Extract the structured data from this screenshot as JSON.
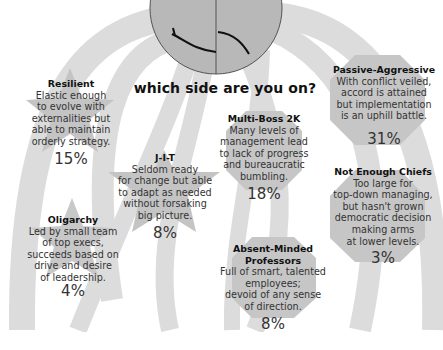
{
  "title": "which side are you on?",
  "center_graphic": {
    "icon": "split-face-icon",
    "left_half": "smile",
    "right_half": "frown"
  },
  "types": [
    {
      "id": "resilient",
      "name": "Resilient",
      "lines": [
        "Elastic enough",
        "to evolve with",
        "externalities but",
        "able to maintain",
        "orderly strategy."
      ],
      "percent": "15%",
      "shape": "star"
    },
    {
      "id": "oligarchy",
      "name": "Oligarchy",
      "lines": [
        "Led by small team",
        "of top execs,",
        "succeeds based on",
        "drive and desire",
        "of leadership."
      ],
      "percent": "4%",
      "shape": "star"
    },
    {
      "id": "jit",
      "name": "J-I-T",
      "lines": [
        "Seldom ready",
        "for  change but able",
        "to adapt as needed",
        "without forsaking",
        "big picture."
      ],
      "percent": "8%",
      "shape": "star"
    },
    {
      "id": "multiboss",
      "name": "Multi-Boss 2K",
      "lines": [
        "Many levels of",
        "management lead",
        "to lack of progress",
        "and bureaucratic",
        "bumbling."
      ],
      "percent": "18%",
      "shape": "octagon"
    },
    {
      "id": "absent",
      "name": "Absent-Minded",
      "name2": "Professors",
      "lines": [
        "Full of smart, talented",
        "employees;",
        "devoid of any sense",
        "of direction."
      ],
      "percent": "8%",
      "shape": "octagon"
    },
    {
      "id": "passive",
      "name": "Passive-Aggressive",
      "lines": [
        "With conflict veiled,",
        "accord is attained",
        "but implementation",
        "is an uphill battle."
      ],
      "percent": "31%",
      "shape": "octagon"
    },
    {
      "id": "chiefs",
      "name": "Not Enough Chiefs",
      "lines": [
        "Too large for",
        "top-down managing,",
        "but hasn't grown",
        "democratic decision",
        "making arms",
        "at lower levels."
      ],
      "percent": "3%",
      "shape": "octagon"
    }
  ]
}
